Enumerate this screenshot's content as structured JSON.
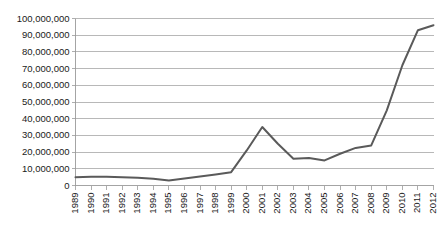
{
  "chart_data": {
    "type": "line",
    "title": "",
    "subtitle": "",
    "xlabel": "",
    "ylabel": "",
    "grid": true,
    "legend": false,
    "legend_position": "none",
    "line_color": "#5a5a5a",
    "gridline_color": "#a6a6a6",
    "axis_color": "#9a9a9a",
    "background_color": "#ffffff",
    "ylim": [
      0,
      100000000
    ],
    "ytick_step": 10000000,
    "ytick_labels": [
      "100,000,000",
      "90,000,000",
      "80,000,000",
      "70,000,000",
      "60,000,000",
      "50,000,000",
      "40,000,000",
      "30,000,000",
      "20,000,000",
      "10,000,000",
      "0"
    ],
    "ytick_values": [
      100000000,
      90000000,
      80000000,
      70000000,
      60000000,
      50000000,
      40000000,
      30000000,
      20000000,
      10000000,
      0
    ],
    "categories": [
      "1989",
      "1990",
      "1991",
      "1992",
      "1993",
      "1994",
      "1995",
      "1996",
      "1997",
      "1998",
      "1999",
      "2000",
      "2001",
      "2002",
      "2003",
      "2004",
      "2005",
      "2006",
      "2007",
      "2008",
      "2009",
      "2010",
      "2011",
      "2012"
    ],
    "xtick_rotation": -90,
    "series": [
      {
        "name": "Series 1",
        "color": "#5a5a5a",
        "values": [
          5000000,
          5200000,
          5300000,
          5000000,
          4600000,
          4000000,
          3000000,
          4200000,
          5400000,
          6600000,
          8000000,
          21000000,
          35000000,
          25000000,
          16000000,
          16500000,
          15000000,
          19000000,
          22500000,
          24000000,
          45000000,
          72000000,
          93000000,
          96000000
        ]
      }
    ]
  }
}
